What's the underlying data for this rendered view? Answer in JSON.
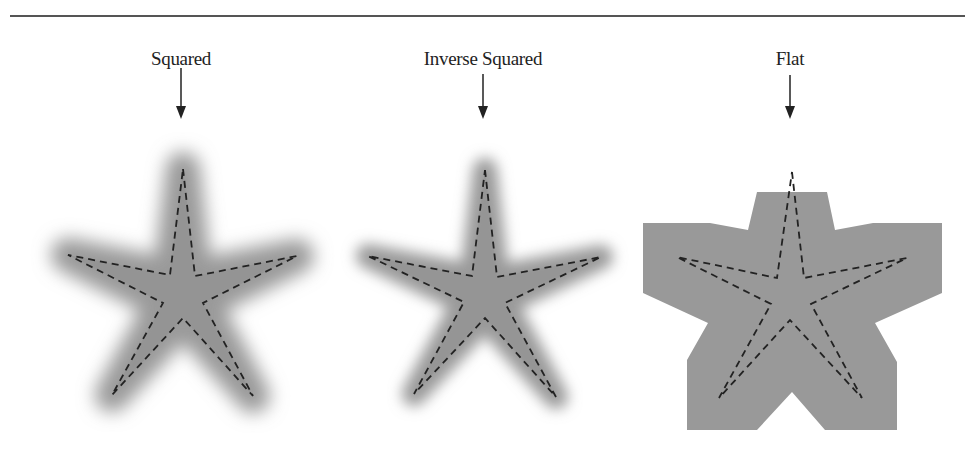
{
  "figure": {
    "panels": [
      {
        "id": "squared",
        "label": "Squared",
        "falloff": "squared"
      },
      {
        "id": "inverse-squared",
        "label": "Inverse Squared",
        "falloff": "inverse-squared"
      },
      {
        "id": "flat",
        "label": "Flat",
        "falloff": "flat"
      }
    ]
  },
  "colors": {
    "fill": "#9a9a9a",
    "dash": "#222222",
    "rule": "#555555",
    "text": "#222222"
  }
}
